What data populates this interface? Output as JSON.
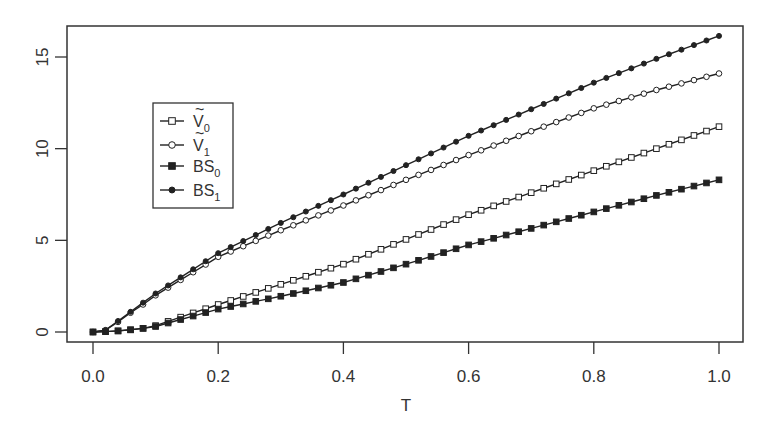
{
  "chart_data": {
    "type": "line",
    "title": "",
    "xlabel": "T",
    "ylabel": "",
    "xlim": [
      0.0,
      1.0
    ],
    "ylim": [
      0,
      16.5
    ],
    "grid": false,
    "legend_position": "upper-left (inset)",
    "x_ticks": [
      "0.0",
      "0.2",
      "0.4",
      "0.6",
      "0.8",
      "1.0"
    ],
    "y_ticks": [
      "0",
      "5",
      "10",
      "15"
    ],
    "marker_step": 0.02,
    "x": [
      0.0,
      0.02,
      0.04,
      0.06,
      0.08,
      0.1,
      0.2,
      0.3,
      0.4,
      0.5,
      0.6,
      0.7,
      0.8,
      0.9,
      1.0
    ],
    "series": [
      {
        "name": "Ṽ0",
        "label_main": "V",
        "label_tilde": true,
        "label_sub": "0",
        "marker": "open-square",
        "values": [
          0.0,
          0.02,
          0.06,
          0.12,
          0.2,
          0.35,
          1.5,
          2.6,
          3.7,
          5.05,
          6.4,
          7.6,
          8.8,
          10.0,
          11.2
        ]
      },
      {
        "name": "Ṽ1",
        "label_main": "V",
        "label_tilde": true,
        "label_sub": "1",
        "marker": "open-circle",
        "values": [
          0.0,
          0.1,
          0.55,
          1.05,
          1.5,
          2.0,
          4.1,
          5.55,
          6.9,
          8.3,
          9.65,
          10.95,
          12.2,
          13.2,
          14.1
        ]
      },
      {
        "name": "BS0",
        "label_main": "BS",
        "label_tilde": false,
        "label_sub": "0",
        "marker": "filled-square",
        "values": [
          0.0,
          0.02,
          0.06,
          0.12,
          0.2,
          0.3,
          1.25,
          1.95,
          2.7,
          3.7,
          4.75,
          5.65,
          6.55,
          7.45,
          8.3
        ]
      },
      {
        "name": "BS1",
        "label_main": "BS",
        "label_tilde": false,
        "label_sub": "1",
        "marker": "filled-circle",
        "values": [
          0.0,
          0.1,
          0.6,
          1.1,
          1.6,
          2.1,
          4.3,
          5.95,
          7.5,
          9.1,
          10.7,
          12.15,
          13.6,
          14.9,
          16.15
        ]
      }
    ]
  },
  "colors": {
    "line": "#222222",
    "axis": "#333333",
    "background": "#ffffff"
  }
}
